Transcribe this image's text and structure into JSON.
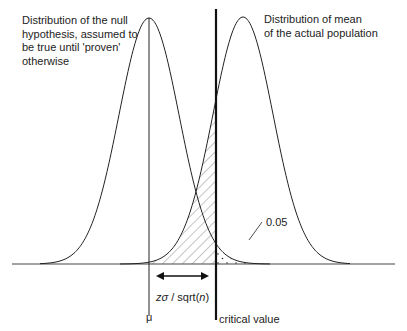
{
  "labels": {
    "null_distribution": "Distribution of the null\nhypothesis, assumed to\nbe true until 'proven'\notherwise",
    "actual_distribution": "Distribution of mean\nof the actual population",
    "alpha": "0.05",
    "mu": "μ",
    "critical_value": "critical value",
    "distance_prefix": "zσ",
    "distance_mid": " / sqrt(",
    "distance_n": "n",
    "distance_suffix": ")"
  },
  "colors": {
    "stroke": "#222222",
    "hatch": "#555555"
  }
}
